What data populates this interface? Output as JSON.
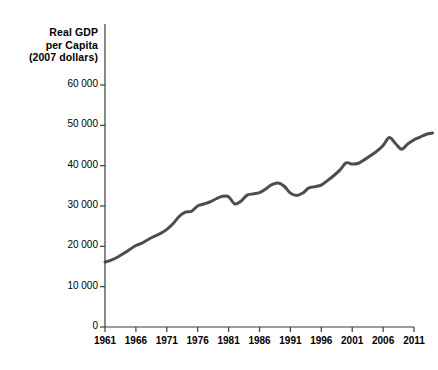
{
  "chart_data": {
    "type": "line",
    "title": "Real GDP per Capita (2007 dollars)",
    "title_lines": [
      "Real GDP",
      "per Capita",
      "(2007 dollars)"
    ],
    "xlabel": "",
    "ylabel": "Real GDP per Capita (2007 dollars)",
    "xlim": [
      1961,
      2015
    ],
    "ylim": [
      0,
      60000
    ],
    "grid": false,
    "legend": "none",
    "line_color": "#4d4d4d",
    "line_width": 3,
    "y_ticks": [
      0,
      10000,
      20000,
      30000,
      40000,
      50000,
      60000
    ],
    "y_tick_labels": [
      "0",
      "10 000",
      "20 000",
      "30 000",
      "40 000",
      "50 000",
      "60 000"
    ],
    "x_ticks": [
      1961,
      1966,
      1971,
      1976,
      1981,
      1986,
      1991,
      1996,
      2001,
      2006,
      2011
    ],
    "x_tick_labels": [
      "1961",
      "1966",
      "1971",
      "1976",
      "1981",
      "1986",
      "1991",
      "1996",
      "2001",
      "2006",
      "2011"
    ],
    "series": [
      {
        "name": "Real GDP per Capita",
        "x": [
          1961,
          1962,
          1963,
          1964,
          1965,
          1966,
          1967,
          1968,
          1969,
          1970,
          1971,
          1972,
          1973,
          1974,
          1975,
          1976,
          1977,
          1978,
          1979,
          1980,
          1981,
          1982,
          1983,
          1984,
          1985,
          1986,
          1987,
          1988,
          1989,
          1990,
          1991,
          1992,
          1993,
          1994,
          1995,
          1996,
          1997,
          1998,
          1999,
          2000,
          2001,
          2002,
          2003,
          2004,
          2005,
          2006,
          2007,
          2008,
          2009,
          2010,
          2011,
          2012,
          2013,
          2014
        ],
        "values": [
          16100,
          16600,
          17300,
          18200,
          19200,
          20200,
          20800,
          21700,
          22500,
          23200,
          24200,
          25600,
          27400,
          28500,
          28700,
          30000,
          30500,
          31000,
          31800,
          32400,
          32300,
          30500,
          31200,
          32700,
          33000,
          33300,
          34200,
          35300,
          35700,
          34900,
          33200,
          32600,
          33200,
          34500,
          34800,
          35200,
          36300,
          37500,
          38900,
          40700,
          40400,
          40600,
          41500,
          42500,
          43600,
          45000,
          47000,
          45500,
          44100,
          45400,
          46400,
          47100,
          47800,
          48100
        ]
      }
    ],
    "annotations": []
  },
  "axis_title": {
    "line1": "Real GDP",
    "line2": "per Capita",
    "line3": "(2007 dollars)"
  }
}
